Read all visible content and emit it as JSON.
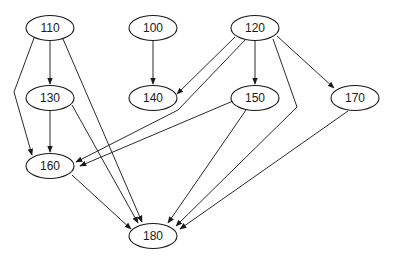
{
  "diagram": {
    "type": "directed-graph",
    "colors": {
      "stroke": "#1a1a1a",
      "background": "#ffffff"
    },
    "nodes": [
      {
        "id": "110",
        "label": "110",
        "cx": 50,
        "cy": 28
      },
      {
        "id": "100",
        "label": "100",
        "cx": 153,
        "cy": 28
      },
      {
        "id": "120",
        "label": "120",
        "cx": 255,
        "cy": 28
      },
      {
        "id": "130",
        "label": "130",
        "cx": 50,
        "cy": 98
      },
      {
        "id": "140",
        "label": "140",
        "cx": 153,
        "cy": 98
      },
      {
        "id": "150",
        "label": "150",
        "cx": 255,
        "cy": 98
      },
      {
        "id": "170",
        "label": "170",
        "cx": 355,
        "cy": 98
      },
      {
        "id": "160",
        "label": "160",
        "cx": 50,
        "cy": 166
      },
      {
        "id": "180",
        "label": "180",
        "cx": 153,
        "cy": 236
      }
    ],
    "edges": [
      {
        "from": "110",
        "to": "130",
        "points": [
          [
            50,
            40
          ],
          [
            50,
            84
          ]
        ]
      },
      {
        "from": "110",
        "to": "160",
        "points": [
          [
            34,
            38
          ],
          [
            14,
            92
          ],
          [
            32,
            155
          ]
        ]
      },
      {
        "from": "110",
        "to": "180",
        "points": [
          [
            63,
            39
          ],
          [
            142,
            222
          ]
        ]
      },
      {
        "from": "100",
        "to": "140",
        "points": [
          [
            153,
            40
          ],
          [
            153,
            84
          ]
        ]
      },
      {
        "from": "120",
        "to": "140",
        "points": [
          [
            235,
            37
          ],
          [
            177,
            94
          ]
        ]
      },
      {
        "from": "120",
        "to": "160",
        "points": [
          [
            245,
            40
          ],
          [
            178,
            110
          ],
          [
            76,
            162
          ]
        ]
      },
      {
        "from": "120",
        "to": "150",
        "points": [
          [
            255,
            40
          ],
          [
            255,
            84
          ]
        ]
      },
      {
        "from": "120",
        "to": "170",
        "points": [
          [
            277,
            36
          ],
          [
            334,
            88
          ]
        ]
      },
      {
        "from": "120",
        "to": "180",
        "points": [
          [
            273,
            39
          ],
          [
            297,
            107
          ],
          [
            176,
            226
          ]
        ]
      },
      {
        "from": "130",
        "to": "160",
        "points": [
          [
            50,
            110
          ],
          [
            50,
            152
          ]
        ]
      },
      {
        "from": "130",
        "to": "180",
        "points": [
          [
            72,
            105
          ],
          [
            138,
            223
          ]
        ]
      },
      {
        "from": "150",
        "to": "160",
        "points": [
          [
            233,
            101
          ],
          [
            80,
            166
          ]
        ]
      },
      {
        "from": "150",
        "to": "180",
        "points": [
          [
            246,
            110
          ],
          [
            168,
            223
          ]
        ]
      },
      {
        "from": "170",
        "to": "180",
        "points": [
          [
            348,
            111
          ],
          [
            180,
            229
          ]
        ]
      },
      {
        "from": "160",
        "to": "180",
        "points": [
          [
            72,
            175
          ],
          [
            131,
            229
          ]
        ]
      }
    ]
  }
}
